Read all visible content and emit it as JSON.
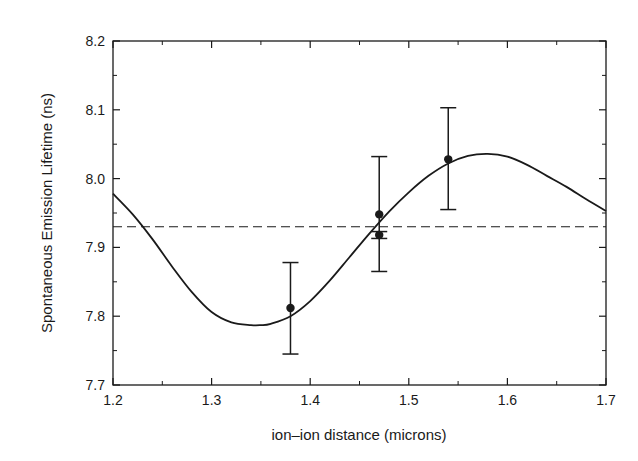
{
  "chart_data": {
    "type": "scatter",
    "title": "",
    "xlabel": "ion–ion distance (microns)",
    "ylabel": "Spontaneous Emission Lifetime (ns)",
    "xlim": [
      1.2,
      1.7
    ],
    "ylim": [
      7.7,
      8.2
    ],
    "xticks": [
      1.2,
      1.3,
      1.4,
      1.5,
      1.6,
      1.7
    ],
    "xtick_labels": [
      "1.2",
      "1.3",
      "1.4",
      "1.5",
      "1.6",
      "1.7"
    ],
    "yticks": [
      7.7,
      7.8,
      7.9,
      8.0,
      8.1,
      8.2
    ],
    "ytick_labels": [
      "7.7",
      "7.8",
      "7.9",
      "8.0",
      "8.1",
      "8.2"
    ],
    "grid": false,
    "legend": null,
    "series": [
      {
        "name": "measured",
        "kind": "scatter-errorbar",
        "points": [
          {
            "x": 1.38,
            "y": 7.812,
            "ylow": 7.745,
            "yhigh": 7.878
          },
          {
            "x": 1.47,
            "y": 7.948,
            "ylow": 7.865,
            "yhigh": 8.032
          },
          {
            "x": 1.47,
            "y": 7.918,
            "ylow": 7.913,
            "yhigh": 7.923
          },
          {
            "x": 1.54,
            "y": 8.028,
            "ylow": 7.955,
            "yhigh": 8.103
          }
        ]
      },
      {
        "name": "theory",
        "kind": "line",
        "style": "solid",
        "x": [
          1.2,
          1.22,
          1.24,
          1.26,
          1.28,
          1.3,
          1.32,
          1.34,
          1.35,
          1.36,
          1.38,
          1.4,
          1.42,
          1.44,
          1.46,
          1.48,
          1.5,
          1.52,
          1.54,
          1.56,
          1.58,
          1.6,
          1.62,
          1.64,
          1.66,
          1.68,
          1.7
        ],
        "y": [
          7.978,
          7.948,
          7.912,
          7.872,
          7.835,
          7.806,
          7.791,
          7.787,
          7.787,
          7.789,
          7.8,
          7.822,
          7.852,
          7.886,
          7.92,
          7.952,
          7.98,
          8.004,
          8.022,
          8.033,
          8.036,
          8.032,
          8.02,
          8.004,
          7.988,
          7.97,
          7.953
        ]
      },
      {
        "name": "reference",
        "kind": "hline",
        "style": "dashed",
        "y": 7.93
      }
    ]
  }
}
